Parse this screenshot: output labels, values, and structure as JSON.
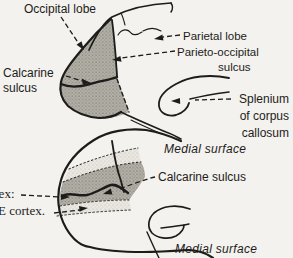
{
  "colors": {
    "background": "#f3f2ee",
    "ink": "#1d1c1a",
    "shade_dark": "#b4b1a9",
    "shade_light": "#e9e7e0"
  },
  "top_diagram": {
    "occipital_lobe": "Occipital lobe",
    "parietal_lobe": "Parietal lobe",
    "parieto_occipital_line1": "Parieto-occipital",
    "parieto_occipital_line2": "sulcus",
    "calcarine_line1": "Calcarine",
    "calcarine_line2": "sulcus",
    "splenium_line1": "Splenium",
    "splenium_line2": "of corpus",
    "splenium_line3": "callosum",
    "caption": "Medial surface"
  },
  "bottom_diagram": {
    "calcarine_sulcus": "Calcarine sulcus",
    "left_label_fragment_top": "tex:",
    "left_label_fragment_bottom": "E cortex.",
    "caption": "Medial surface"
  }
}
